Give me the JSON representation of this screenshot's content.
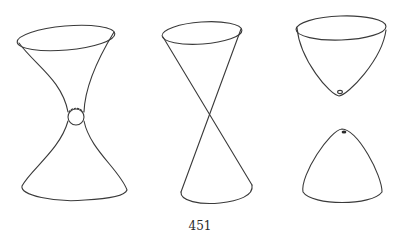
{
  "page": {
    "page_number": "451"
  },
  "figures": [
    {
      "name": "hyperboloid-one-sheet",
      "description": "hourglass surface with circular neck"
    },
    {
      "name": "double-cone",
      "description": "two cones meeting at a vertex"
    },
    {
      "name": "hyperboloid-two-sheets",
      "description": "two separate bowl-shaped sheets"
    }
  ],
  "colors": {
    "stroke": "#3a3a3a",
    "background": "#ffffff"
  }
}
